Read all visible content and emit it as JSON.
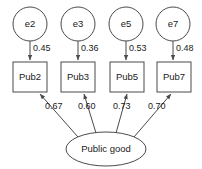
{
  "diagram": {
    "type": "sem-path-diagram",
    "title": "",
    "colors": {
      "background": "#ffffff",
      "stroke": "#4a4a4a",
      "text": "#1a1a1a",
      "fill": "#ffffff"
    },
    "error_terms": [
      {
        "id": "e2",
        "label": "e2",
        "cx": 30,
        "cy": 24,
        "r": 17
      },
      {
        "id": "e3",
        "label": "e3",
        "cx": 78,
        "cy": 24,
        "r": 17
      },
      {
        "id": "e5",
        "label": "e5",
        "cx": 126,
        "cy": 24,
        "r": 17
      },
      {
        "id": "e7",
        "label": "e7",
        "cx": 173,
        "cy": 24,
        "r": 17
      }
    ],
    "indicators": [
      {
        "id": "Pub2",
        "label": "Pub2",
        "x": 13,
        "y": 62,
        "w": 34,
        "h": 30
      },
      {
        "id": "Pub3",
        "label": "Pub3",
        "x": 61,
        "y": 62,
        "w": 34,
        "h": 30
      },
      {
        "id": "Pub5",
        "label": "Pub5",
        "x": 110,
        "y": 62,
        "w": 34,
        "h": 30
      },
      {
        "id": "Pub7",
        "label": "Pub7",
        "x": 157,
        "y": 62,
        "w": 34,
        "h": 30
      }
    ],
    "latent": {
      "id": "public-good",
      "label": "Public good",
      "cx": 106,
      "cy": 149,
      "rx": 40,
      "ry": 17
    },
    "error_paths": [
      {
        "from": "e2",
        "to": "Pub2",
        "value": "0.45",
        "lx": 31,
        "ly": 49
      },
      {
        "from": "e3",
        "to": "Pub3",
        "value": "0.36",
        "lx": 79,
        "ly": 49
      },
      {
        "from": "e5",
        "to": "Pub5",
        "value": "0.53",
        "lx": 127,
        "ly": 49
      },
      {
        "from": "e7",
        "to": "Pub7",
        "value": "0.48",
        "lx": 174,
        "ly": 49
      }
    ],
    "loading_paths": [
      {
        "from": "public-good",
        "to": "Pub2",
        "value": "0.67",
        "lx": 45,
        "ly": 107
      },
      {
        "from": "public-good",
        "to": "Pub3",
        "value": "0.60",
        "lx": 78,
        "ly": 107
      },
      {
        "from": "public-good",
        "to": "Pub5",
        "value": "0.73",
        "lx": 113,
        "ly": 107
      },
      {
        "from": "public-good",
        "to": "Pub7",
        "value": "0.70",
        "lx": 148,
        "ly": 107
      }
    ]
  }
}
